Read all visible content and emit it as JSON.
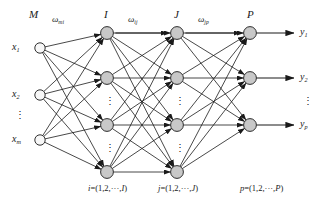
{
  "figure": {
    "type": "neural-network-architecture-diagram"
  },
  "layer_labels": {
    "input": "M",
    "hidden1": "I",
    "hidden2": "J",
    "output": "P"
  },
  "weight_labels": {
    "input_to_hidden1_sym": "ω",
    "input_to_hidden1_sub": "mi",
    "hidden1_to_hidden2_sym": "ω",
    "hidden1_to_hidden2_sub": "ij",
    "hidden2_to_output_sym": "ω",
    "hidden2_to_output_sub": "jp"
  },
  "inputs": [
    {
      "sym": "x",
      "sub": "1"
    },
    {
      "sym": "x",
      "sub": "2"
    },
    {
      "sym": "x",
      "sub": "m"
    }
  ],
  "input_ellipsis": "⋮",
  "outputs": [
    {
      "sym": "y",
      "sub": "1"
    },
    {
      "sym": "y",
      "sub": "2"
    },
    {
      "sym": "y",
      "sub": "p"
    }
  ],
  "output_ellipsis": "⋮",
  "index_captions": {
    "hidden1": {
      "var": "i",
      "eq": "=(1,2,···,",
      "end": "I",
      "close": ")"
    },
    "hidden2": {
      "var": "j",
      "eq": "=(1,2,···,",
      "end": "J",
      "close": ")"
    },
    "output": {
      "var": "p",
      "eq": "=(1,2,···,",
      "end": "P",
      "close": ")"
    }
  },
  "column_ellipsis": "⋮",
  "colors": {
    "node_fill_hidden": "#c8c8c8",
    "node_fill_input": "#f7f7f7",
    "node_stroke": "#1a1a1a",
    "edge": "#1a1a1a",
    "text": "#1a1a1a",
    "background": "#ffffff"
  },
  "geometry": {
    "node_radius_input": 5.2,
    "node_radius_hidden": 6.4,
    "node_radius_output": 6.4,
    "input_x": 40,
    "hidden1_x": 107,
    "hidden2_x": 177,
    "output_x": 250,
    "input_y": [
      48,
      95,
      140
    ],
    "hidden1_y": [
      33,
      78,
      125,
      172
    ],
    "hidden2_y": [
      33,
      78,
      125,
      172
    ],
    "output_y": [
      33,
      78,
      125
    ],
    "arrow_end_x": 294
  }
}
